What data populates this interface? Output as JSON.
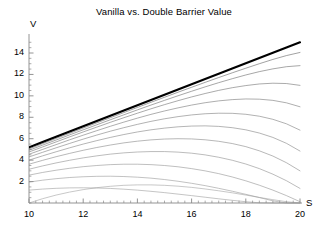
{
  "chart_data": {
    "type": "line",
    "title": "Vanilla vs. Double Barrier Value",
    "xlabel": "S",
    "ylabel": "V",
    "xlim": [
      10,
      20
    ],
    "ylim": [
      0,
      15.4
    ],
    "grid": false,
    "legend": "none",
    "xticks": [
      10,
      12,
      14,
      16,
      18,
      20
    ],
    "xtick_labels": [
      "10",
      "12",
      "14",
      "16",
      "18",
      "20"
    ],
    "yticks": [
      2,
      4,
      6,
      8,
      10,
      12,
      14
    ],
    "ytick_labels": [
      "2",
      "4",
      "6",
      "8",
      "10",
      "12",
      "14"
    ],
    "x": [
      10,
      10.5,
      11,
      11.5,
      12,
      12.5,
      13,
      13.5,
      14,
      14.5,
      15,
      15.5,
      16,
      16.5,
      17,
      17.5,
      18,
      18.5,
      19,
      19.5,
      20
    ],
    "series": [
      {
        "name": "Vanilla",
        "style": "thick-black",
        "color": "#000000",
        "width": 2.1,
        "values": [
          5.2,
          5.69,
          6.18,
          6.67,
          7.16,
          7.65,
          8.14,
          8.63,
          9.12,
          9.61,
          10.1,
          10.59,
          11.08,
          11.57,
          12.06,
          12.55,
          13.04,
          13.53,
          14.02,
          14.51,
          15.0
        ]
      },
      {
        "name": "Double Barrier 1",
        "style": "thin-gray",
        "color": "#555555",
        "width": 0.55,
        "values": [
          5.05,
          5.54,
          6.03,
          6.51,
          7.0,
          7.48,
          7.96,
          8.44,
          8.92,
          9.4,
          9.87,
          10.34,
          10.8,
          11.26,
          11.71,
          12.15,
          12.58,
          13.0,
          13.4,
          13.76,
          14.05
        ]
      },
      {
        "name": "Double Barrier 2",
        "style": "thin-gray",
        "color": "#5e5e5e",
        "width": 0.55,
        "values": [
          4.92,
          5.4,
          5.88,
          6.36,
          6.83,
          7.3,
          7.77,
          8.23,
          8.69,
          9.14,
          9.58,
          10.01,
          10.43,
          10.84,
          11.23,
          11.6,
          11.95,
          12.26,
          12.52,
          12.72,
          12.82
        ]
      },
      {
        "name": "Double Barrier 3",
        "style": "thin-gray",
        "color": "#656565",
        "width": 0.55,
        "values": [
          4.76,
          5.23,
          5.7,
          6.17,
          6.63,
          7.08,
          7.53,
          7.96,
          8.38,
          8.79,
          9.18,
          9.55,
          9.9,
          10.22,
          10.51,
          10.76,
          10.96,
          11.11,
          11.18,
          11.15,
          10.98
        ]
      },
      {
        "name": "Double Barrier 4",
        "style": "thin-gray",
        "color": "#6b6b6b",
        "width": 0.55,
        "values": [
          4.55,
          5.0,
          5.45,
          5.9,
          6.33,
          6.75,
          7.16,
          7.55,
          7.92,
          8.27,
          8.59,
          8.88,
          9.14,
          9.36,
          9.53,
          9.65,
          9.71,
          9.69,
          9.58,
          9.35,
          8.98
        ]
      },
      {
        "name": "Double Barrier 5",
        "style": "thin-gray",
        "color": "#717171",
        "width": 0.55,
        "values": [
          4.3,
          4.73,
          5.15,
          5.56,
          5.96,
          6.34,
          6.7,
          7.03,
          7.34,
          7.62,
          7.86,
          8.06,
          8.22,
          8.33,
          8.38,
          8.37,
          8.28,
          8.1,
          7.81,
          7.39,
          6.8
        ]
      },
      {
        "name": "Double Barrier 6",
        "style": "thin-gray",
        "color": "#777777",
        "width": 0.55,
        "values": [
          4.0,
          4.4,
          4.78,
          5.15,
          5.5,
          5.82,
          6.12,
          6.39,
          6.63,
          6.83,
          6.99,
          7.11,
          7.18,
          7.2,
          7.15,
          7.03,
          6.83,
          6.53,
          6.12,
          5.57,
          4.85
        ]
      },
      {
        "name": "Double Barrier 7",
        "style": "thin-gray",
        "color": "#7d7d7d",
        "width": 0.55,
        "values": [
          3.62,
          3.98,
          4.32,
          4.63,
          4.92,
          5.18,
          5.41,
          5.61,
          5.77,
          5.89,
          5.97,
          6.0,
          5.98,
          5.9,
          5.76,
          5.55,
          5.26,
          4.87,
          4.38,
          3.76,
          3.0
        ]
      },
      {
        "name": "Double Barrier 8",
        "style": "thin-gray",
        "color": "#848484",
        "width": 0.55,
        "values": [
          3.15,
          3.46,
          3.74,
          3.99,
          4.21,
          4.4,
          4.56,
          4.68,
          4.76,
          4.8,
          4.8,
          4.75,
          4.65,
          4.49,
          4.27,
          3.99,
          3.64,
          3.21,
          2.69,
          2.08,
          1.36
        ]
      },
      {
        "name": "Double Barrier 9",
        "style": "thin-gray",
        "color": "#8a8a8a",
        "width": 0.55,
        "values": [
          2.6,
          2.85,
          3.06,
          3.24,
          3.39,
          3.5,
          3.58,
          3.62,
          3.62,
          3.58,
          3.5,
          3.38,
          3.21,
          3.0,
          2.74,
          2.43,
          2.07,
          1.66,
          1.2,
          0.69,
          0.12
        ]
      },
      {
        "name": "Double Barrier 10",
        "style": "thin-gray",
        "color": "#8f8f8f",
        "width": 0.55,
        "values": [
          1.95,
          2.13,
          2.27,
          2.38,
          2.45,
          2.49,
          2.5,
          2.47,
          2.41,
          2.32,
          2.19,
          2.03,
          1.84,
          1.62,
          1.37,
          1.1,
          0.81,
          0.51,
          0.2,
          0.0,
          0.0
        ]
      },
      {
        "name": "Double Barrier 11",
        "style": "thin-gray",
        "color": "#959595",
        "width": 0.55,
        "values": [
          1.2,
          1.3,
          1.37,
          1.41,
          1.42,
          1.4,
          1.36,
          1.29,
          1.2,
          1.09,
          0.97,
          0.83,
          0.69,
          0.54,
          0.39,
          0.25,
          0.12,
          0.02,
          0.0,
          0.0,
          0.0
        ]
      },
      {
        "name": "Double Barrier 12",
        "style": "thin-gray",
        "color": "#9b9b9b",
        "width": 0.55,
        "values": [
          0.0,
          0.4,
          0.74,
          1.02,
          1.25,
          1.43,
          1.56,
          1.65,
          1.69,
          1.69,
          1.65,
          1.57,
          1.46,
          1.31,
          1.14,
          0.95,
          0.74,
          0.52,
          0.31,
          0.12,
          0.0
        ]
      }
    ]
  },
  "axes": {
    "y_name": "V",
    "x_name": "S"
  },
  "colors": {
    "axis": "#888888",
    "vanilla": "#000000",
    "barrier": "#8a8a8a",
    "text": "#000000",
    "background": "#ffffff"
  }
}
